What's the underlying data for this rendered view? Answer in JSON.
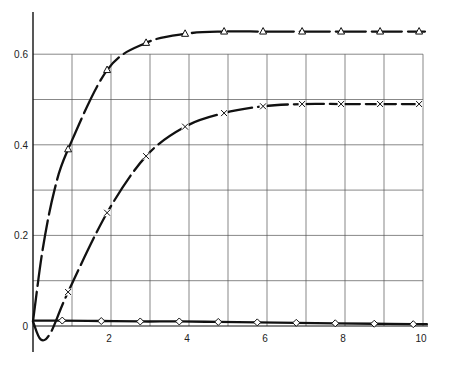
{
  "chart_data": {
    "type": "line",
    "title": "",
    "xlabel": "",
    "ylabel": "",
    "xlim": [
      0,
      10
    ],
    "ylim": [
      0,
      0.7
    ],
    "grid": true,
    "legend": null,
    "x_ticks": [
      "2",
      "4",
      "6",
      "8",
      "10"
    ],
    "y_ticks": [
      "0",
      "0.2",
      "0.4",
      "0.6"
    ],
    "origin_label": "0",
    "series": [
      {
        "name": "triangle",
        "marker": "triangle",
        "x": [
          0.9,
          1.9,
          2.9,
          3.9,
          4.9,
          5.9,
          6.9,
          7.9,
          8.9,
          9.9
        ],
        "values": [
          0.39,
          0.565,
          0.625,
          0.645,
          0.65,
          0.65,
          0.65,
          0.65,
          0.65,
          0.65
        ]
      },
      {
        "name": "cross",
        "marker": "x",
        "x": [
          0.9,
          1.9,
          2.9,
          3.9,
          4.9,
          5.9,
          6.9,
          7.9,
          8.9,
          9.9
        ],
        "values": [
          0.075,
          0.25,
          0.375,
          0.44,
          0.47,
          0.485,
          0.49,
          0.49,
          0.49,
          0.49
        ]
      },
      {
        "name": "diamond",
        "marker": "diamond",
        "x": [
          0.75,
          1.75,
          2.75,
          3.75,
          4.75,
          5.75,
          6.75,
          7.75,
          8.75,
          9.75
        ],
        "values": [
          0.012,
          0.011,
          0.01,
          0.01,
          0.009,
          0.008,
          0.007,
          0.006,
          0.005,
          0.004
        ]
      }
    ]
  }
}
